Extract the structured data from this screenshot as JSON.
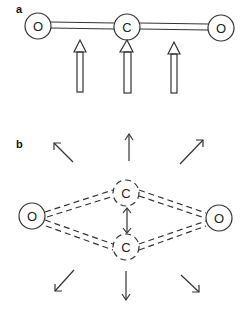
{
  "panels": [
    {
      "label": "a",
      "atoms": [
        {
          "symbol": "O",
          "x": 38,
          "y": 26
        },
        {
          "symbol": "C",
          "x": 127,
          "y": 27
        },
        {
          "symbol": "O",
          "x": 221,
          "y": 28
        }
      ],
      "description": "Linear CO2 molecule with double bonds; three upward arrows under O, C, O (bending vibration)"
    },
    {
      "label": "b",
      "atoms": [
        {
          "symbol": "O",
          "x": 32,
          "y": 216
        },
        {
          "symbol": "C",
          "x": 126,
          "y": 193
        },
        {
          "symbol": "C",
          "x": 126,
          "y": 247
        },
        {
          "symbol": "O",
          "x": 219,
          "y": 218
        }
      ],
      "description": "Bent CO2 with dashed bonds, carbon oscillating between two positions; arrows radiating outward"
    }
  ]
}
